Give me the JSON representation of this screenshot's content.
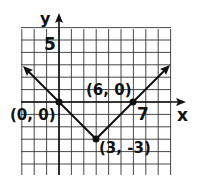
{
  "chart_data": {
    "type": "line",
    "title": "",
    "xlabel": "x",
    "ylabel": "y",
    "xlim": [
      -4,
      8
    ],
    "ylim": [
      -6,
      6
    ],
    "grid": true,
    "tick_labels": {
      "x": [
        "7"
      ],
      "y": [
        "5"
      ]
    },
    "series": [
      {
        "name": "absolute value graph",
        "x": [
          -3,
          0,
          3,
          6,
          9
        ],
        "y": [
          3,
          0,
          -3,
          0,
          3
        ]
      }
    ],
    "points": [
      {
        "label": "(0, 0)",
        "x": 0,
        "y": 0
      },
      {
        "label": "(3, -3)",
        "x": 3,
        "y": -3
      },
      {
        "label": "(6, 0)",
        "x": 6,
        "y": 0
      }
    ]
  },
  "labels": {
    "x_axis": "x",
    "y_axis": "y",
    "tick_x": "7",
    "tick_y": "5",
    "p1": "(0, 0)",
    "p2": "(3, -3)",
    "p3": "(6, 0)"
  }
}
